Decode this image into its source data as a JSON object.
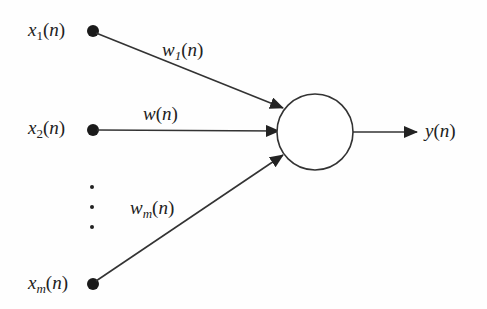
{
  "diagram": {
    "type": "single-neuron / perceptron",
    "inputs": [
      {
        "base": "x",
        "sub": "1",
        "arg": "n",
        "x": 93,
        "y": 31
      },
      {
        "base": "x",
        "sub": "2",
        "arg": "n",
        "x": 93,
        "y": 130
      },
      {
        "base": "x",
        "sub": "m",
        "arg": "n",
        "x": 93,
        "y": 284
      }
    ],
    "weights": [
      {
        "base": "w",
        "sub": "1",
        "arg": "n"
      },
      {
        "base": "w",
        "sub": "",
        "arg": "n"
      },
      {
        "base": "w",
        "sub": "m",
        "arg": "n"
      }
    ],
    "ellipsis_dots": [
      187,
      207,
      227
    ],
    "neuron": {
      "cx": 315,
      "cy": 132,
      "r": 38
    },
    "output": {
      "base": "y",
      "arg": "n"
    },
    "colors": {
      "stroke": "#333333",
      "text": "#222222",
      "background": "#fefefe"
    }
  }
}
